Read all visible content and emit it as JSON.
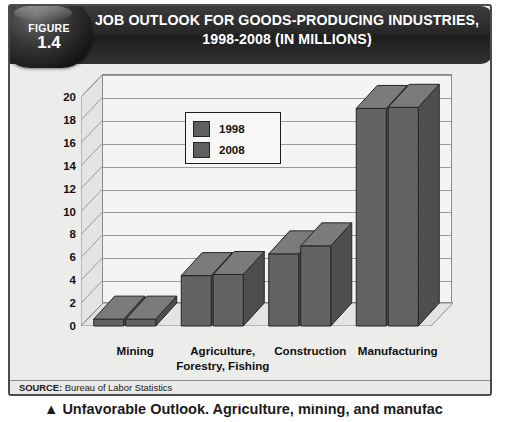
{
  "figure": {
    "badge_word": "FIGURE",
    "badge_number": "1.4",
    "title_line1": "JOB OUTLOOK FOR GOODS-PRODUCING INDUSTRIES,",
    "title_line2": "1998-2008 (IN MILLIONS)",
    "source_prefix": "SOURCE:",
    "source_text": " Bureau of Labor Statistics"
  },
  "body_excerpt": {
    "clipped_line": "▲  Unfavorable Outlook. Agriculture, mining, and manufac"
  },
  "colors": {
    "banner": "#2e2e2e",
    "card_background": "#e9e9e7",
    "plot_background": "#f4f4f3",
    "bar_1998": "#666666",
    "bar_2008": "#666666",
    "bar_outline": "#2b2b2b",
    "gridline": "#9a9a9a",
    "text": "#111111"
  },
  "chart_data": {
    "type": "bar",
    "title": "JOB OUTLOOK FOR GOODS-PRODUCING INDUSTRIES, 1998-2008 (IN MILLIONS)",
    "xlabel": "",
    "ylabel": "",
    "ylim": [
      0,
      20
    ],
    "ytick_step": 2,
    "yticks": [
      0,
      2,
      4,
      6,
      8,
      10,
      12,
      14,
      16,
      18,
      20
    ],
    "grid": true,
    "legend_position": "inside-top-left",
    "three_d": true,
    "categories": [
      "Mining",
      "Agriculture, Forestry, Fishing",
      "Construction",
      "Manufacturing"
    ],
    "category_lines": [
      [
        "Mining"
      ],
      [
        "Agriculture,",
        "Forestry, Fishing"
      ],
      [
        "Construction"
      ],
      [
        "Manufacturing"
      ]
    ],
    "series": [
      {
        "name": "1998",
        "values": [
          0.6,
          4.4,
          6.3,
          19.0
        ]
      },
      {
        "name": "2008",
        "values": [
          0.6,
          4.5,
          7.0,
          19.1
        ]
      }
    ]
  }
}
